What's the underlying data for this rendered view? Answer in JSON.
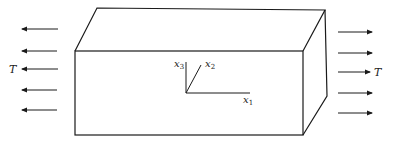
{
  "diagram": {
    "colors": {
      "line": "#1a1a1a",
      "background": "#ffffff"
    },
    "left_load": {
      "label": "T",
      "direction": "left",
      "arrow_count": 5
    },
    "right_load": {
      "label": "T",
      "direction": "right",
      "arrow_count": 5
    },
    "axes": {
      "x1": {
        "base": "x",
        "sub": "1"
      },
      "x2": {
        "base": "x",
        "sub": "2"
      },
      "x3": {
        "base": "x",
        "sub": "3"
      }
    }
  }
}
